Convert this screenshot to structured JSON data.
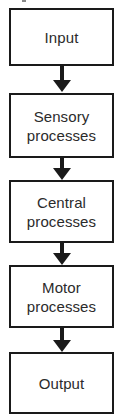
{
  "diagram": {
    "type": "flowchart",
    "orientation": "vertical-top-to-bottom",
    "title": "",
    "colors": {
      "box_border": "#1a1a1a",
      "box_fill": "#ffffff",
      "text": "#2b2b2b",
      "arrow": "#1a1a1a",
      "background": "#ffffff"
    },
    "nodes": [
      {
        "id": "input",
        "label": "Input"
      },
      {
        "id": "sensory-processes",
        "label": "Sensory\nprocesses"
      },
      {
        "id": "central-processes",
        "label": "Central\nprocesses"
      },
      {
        "id": "motor-processes",
        "label": "Motor\nprocesses"
      },
      {
        "id": "output",
        "label": "Output"
      }
    ],
    "edges": [
      {
        "from": "input",
        "to": "sensory-processes",
        "marker": "arrow-down"
      },
      {
        "from": "sensory-processes",
        "to": "central-processes",
        "marker": "arrow-down"
      },
      {
        "from": "central-processes",
        "to": "motor-processes",
        "marker": "arrow-down"
      },
      {
        "from": "motor-processes",
        "to": "output",
        "marker": "arrow-down"
      }
    ]
  }
}
